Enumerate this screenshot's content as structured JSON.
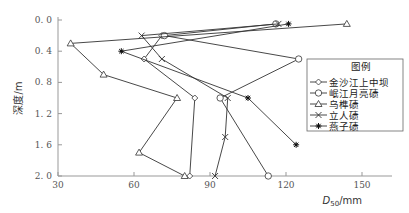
{
  "chart_data": {
    "type": "line",
    "title": "",
    "xlabel": "D50/mm",
    "xlabel_main": "D",
    "xlabel_sub": "50",
    "xlabel_unit": "/mm",
    "ylabel": "深度/m",
    "xlim": [
      30,
      150
    ],
    "ylim": [
      2.0,
      0.0
    ],
    "y_inverted": true,
    "x_ticks": [
      30,
      60,
      90,
      120,
      150
    ],
    "y_ticks": [
      "0.0",
      "0.4",
      "0.8",
      "1.2",
      "1.6",
      "2.0"
    ],
    "grid": false,
    "legend_title": "图例",
    "legend_position": "right",
    "series": [
      {
        "name": "金沙江上中坝",
        "marker": "diamond",
        "points": [
          [
            71,
            0.2
          ],
          [
            64,
            0.5
          ],
          [
            84,
            1.0
          ],
          [
            82,
            2.0
          ]
        ]
      },
      {
        "name": "岷江月亮碛",
        "marker": "circle",
        "points": [
          [
            116,
            0.05
          ],
          [
            72,
            0.2
          ],
          [
            125,
            0.5
          ],
          [
            94,
            1.0
          ],
          [
            113,
            2.0
          ]
        ]
      },
      {
        "name": "乌榫碛",
        "marker": "triangle",
        "points": [
          [
            144,
            0.05
          ],
          [
            35,
            0.3
          ],
          [
            48,
            0.7
          ],
          [
            77,
            1.0
          ],
          [
            62,
            1.7
          ],
          [
            80,
            2.0
          ]
        ]
      },
      {
        "name": "立人碛",
        "marker": "x",
        "points": [
          [
            117,
            0.05
          ],
          [
            63,
            0.2
          ],
          [
            71,
            0.5
          ],
          [
            97,
            1.0
          ],
          [
            96,
            1.5
          ],
          [
            92,
            2.0
          ]
        ]
      },
      {
        "name": "燕子碛",
        "marker": "star",
        "points": [
          [
            121,
            0.05
          ],
          [
            55,
            0.4
          ],
          [
            105,
            1.0
          ],
          [
            124,
            1.6
          ]
        ]
      }
    ]
  }
}
